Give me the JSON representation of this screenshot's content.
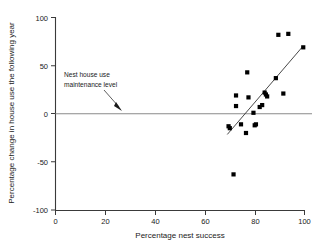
{
  "chart_data": {
    "type": "scatter",
    "title": "",
    "xlabel": "Percentage nest success",
    "ylabel": "Percentage change in house use the following year",
    "xlim": [
      0,
      100
    ],
    "ylim": [
      -100,
      100
    ],
    "xticks": [
      0,
      20,
      40,
      60,
      80,
      100
    ],
    "yticks": [
      -100,
      -50,
      0,
      50,
      100
    ],
    "xtick_labels": [
      "0",
      "20",
      "40",
      "60",
      "80",
      "100"
    ],
    "ytick_labels": [
      "-100",
      "-50",
      "0",
      "50",
      "100"
    ],
    "grid": false,
    "legend": null,
    "marker_style": "filled-square",
    "marker_color": "#000000",
    "points": [
      {
        "x": 69.5,
        "y": -13
      },
      {
        "x": 70.0,
        "y": -15
      },
      {
        "x": 71.5,
        "y": -63
      },
      {
        "x": 72.5,
        "y": 19
      },
      {
        "x": 72.5,
        "y": 8
      },
      {
        "x": 74.5,
        "y": -11
      },
      {
        "x": 76.5,
        "y": -20
      },
      {
        "x": 77.0,
        "y": 43
      },
      {
        "x": 77.5,
        "y": 17
      },
      {
        "x": 79.5,
        "y": 1
      },
      {
        "x": 80.0,
        "y": -12
      },
      {
        "x": 80.5,
        "y": -11
      },
      {
        "x": 82.0,
        "y": 7
      },
      {
        "x": 83.0,
        "y": 9
      },
      {
        "x": 84.0,
        "y": 22
      },
      {
        "x": 84.5,
        "y": 20
      },
      {
        "x": 85.0,
        "y": 18
      },
      {
        "x": 88.5,
        "y": 37
      },
      {
        "x": 89.5,
        "y": 82
      },
      {
        "x": 91.5,
        "y": 21
      },
      {
        "x": 93.5,
        "y": 83
      },
      {
        "x": 99.5,
        "y": 69
      }
    ],
    "trend_line": {
      "name": "regression-line",
      "x_start": 69.0,
      "y_start": -21.5,
      "x_end": 99.0,
      "y_end": 69.0
    },
    "reference_line": {
      "name": "nest-house-use-maintenance-level",
      "y": 0,
      "color": "#8a8a8a"
    },
    "annotation": {
      "line1": "Nest house use",
      "line2": "maintenance level",
      "points_to_x": 30,
      "points_to_y": 0
    }
  }
}
